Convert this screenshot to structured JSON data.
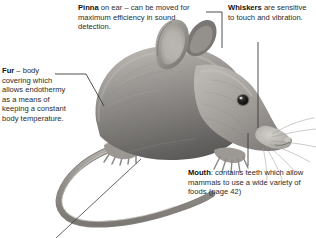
{
  "figure": {
    "subject_description": "Grayscale photographic illustration of a mouse facing right, showing fur, ears, eye, whiskers, snout, feet and long curving tail",
    "background_color": "#ffffff",
    "text_color": "#2b2b2b",
    "term_color": "#111111",
    "leader_line_color": "#3c3c3c"
  },
  "callouts": [
    {
      "id": "pinna",
      "term": "Pinna",
      "body": " on ear – can be moved for maximum efficiency in sound detection.",
      "points_to": "ear"
    },
    {
      "id": "whiskers",
      "term": "Whiskers",
      "body": " are sensitive to touch and vibration.",
      "points_to": "whiskers"
    },
    {
      "id": "fur",
      "term": "Fur",
      "body": " – body covering which allows endothermy as a means of keeping a constant body temperature.",
      "points_to": "back-fur"
    },
    {
      "id": "mouth",
      "term": "Mouth",
      "body": ": contains teeth which allow mammals to use a wide variety of foods (page 42)",
      "points_to": "mouth"
    }
  ]
}
